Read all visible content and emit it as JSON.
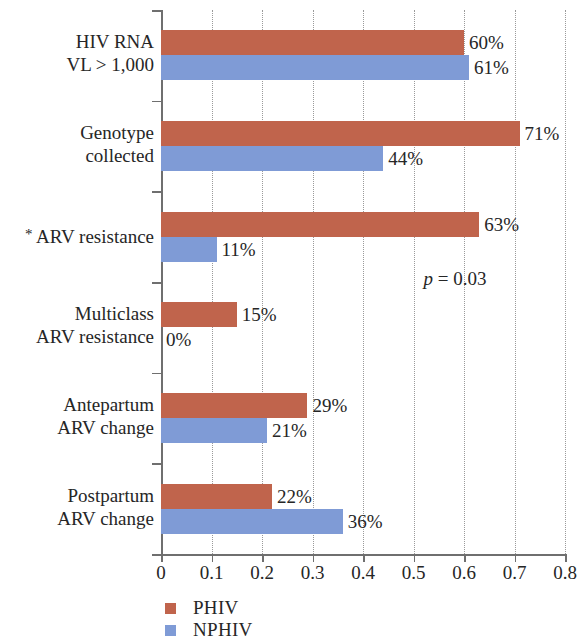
{
  "chart_data": {
    "type": "bar",
    "orientation": "horizontal",
    "title": "",
    "xlabel": "",
    "ylabel": "",
    "xlim": [
      0,
      0.8
    ],
    "xticks": [
      "0",
      "0.1",
      "0.2",
      "0.3",
      "0.4",
      "0.5",
      "0.6",
      "0.7",
      "0.8"
    ],
    "xtick_values": [
      0,
      0.1,
      0.2,
      0.3,
      0.4,
      0.5,
      0.6,
      0.7,
      0.8
    ],
    "grid": "vertical-dotted",
    "legend_position": "bottom-left",
    "categories": [
      "HIV RNA VL > 1,000",
      "Genotype collected",
      "* ARV resistance",
      "Multiclass ARV resistance",
      "Antepartum ARV change",
      "Postpartum ARV change"
    ],
    "category_lines": [
      [
        "HIV RNA",
        "VL > 1,000"
      ],
      [
        "Genotype",
        "collected"
      ],
      [
        "ARV resistance"
      ],
      [
        "Multiclass",
        "ARV resistance"
      ],
      [
        "Antepartum",
        "ARV change"
      ],
      [
        "Postpartum",
        "ARV change"
      ]
    ],
    "series": [
      {
        "name": "PHIV",
        "color": "#c0644c",
        "values": [
          0.6,
          0.71,
          0.63,
          0.15,
          0.29,
          0.22
        ],
        "labels": [
          "60%",
          "71%",
          "63%",
          "15%",
          "29%",
          "22%"
        ]
      },
      {
        "name": "NPHIV",
        "color": "#7f9bd6",
        "values": [
          0.61,
          0.44,
          0.11,
          0.0,
          0.21,
          0.36
        ],
        "labels": [
          "61%",
          "44%",
          "11%",
          "0%",
          "21%",
          "36%"
        ]
      }
    ],
    "annotations": [
      {
        "text_italic": "p",
        "text_rest": " = 0.03",
        "full": "p = 0.03",
        "x": 0.52,
        "row": 3
      }
    ],
    "footnote_marker": "*"
  },
  "legend": {
    "items": [
      {
        "label": "PHIV",
        "color": "#c0644c"
      },
      {
        "label": "NPHIV",
        "color": "#7f9bd6"
      }
    ]
  }
}
